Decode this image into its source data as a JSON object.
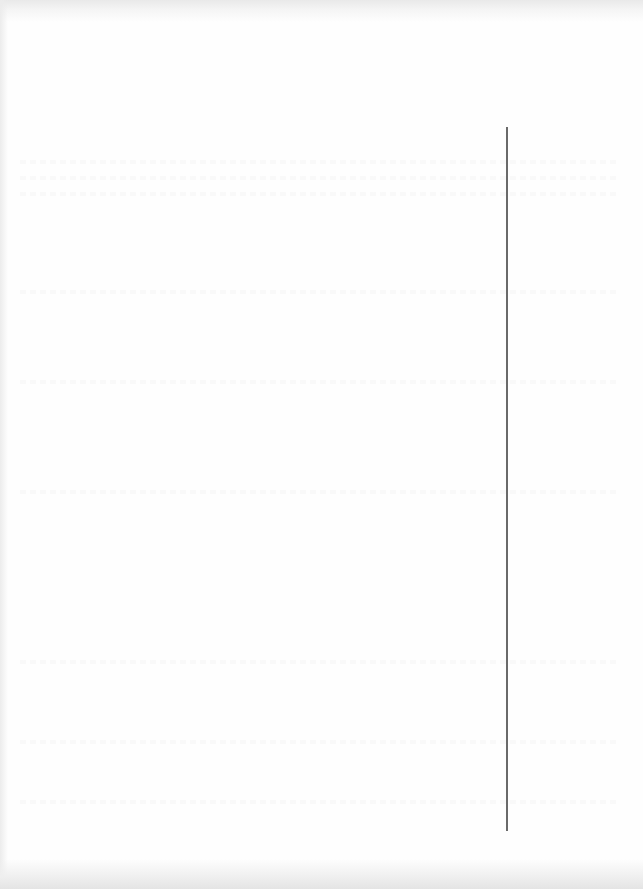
{
  "page": {
    "type": "scanned blank verso page",
    "background_color": "#fefefe",
    "edge_shadow_color": "#e6e6e6"
  },
  "vertical_rule": {
    "x": 507,
    "y_start": 127,
    "y_end": 831,
    "color": "#6a6a6a"
  },
  "text": []
}
